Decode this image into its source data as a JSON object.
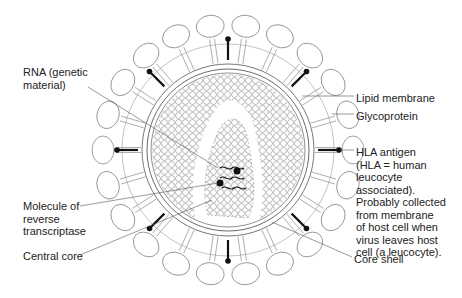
{
  "diagram": {
    "labels": {
      "rna": "RNA (genetic\nmaterial)",
      "molecule": "Molecule of\nreverse\ntranscriptase",
      "central_core": "Central core",
      "lipid_membrane": "Lipid membrane",
      "glycoprotein": "Glycoprotein",
      "hla_antigen": "HLA antigen\n(HLA = human\nleucocyte\nassociated).\nProbably collected\nfrom membrane\nof host cell when\nvirus leaves host\ncell (a leucocyte).",
      "core_shell": "Core shell"
    },
    "colors": {
      "line": "#555555",
      "dark": "#111111",
      "background": "#ffffff"
    }
  }
}
